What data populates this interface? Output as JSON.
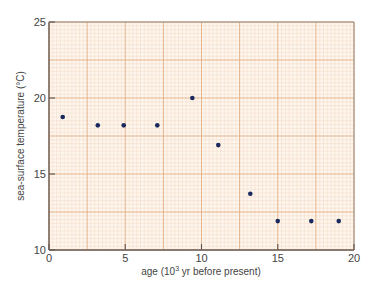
{
  "chart_data": {
    "type": "scatter",
    "title": "",
    "xlabel": "age (10^3 yr before present)",
    "xlabel_parts": {
      "pre": "age (10",
      "sup": "3",
      "post": " yr before present)"
    },
    "ylabel": "sea-surface temperature (°C)",
    "xlim": [
      0,
      20
    ],
    "ylim": [
      10,
      25
    ],
    "xticks": [
      0,
      5,
      10,
      15,
      20
    ],
    "yticks": [
      10,
      15,
      20,
      25
    ],
    "grid": true,
    "grid_major_step": 2.5,
    "grid_minor_step": 0.25,
    "legend": null,
    "series": [
      {
        "name": "sea-surface temperature",
        "color": "#1a2a5e",
        "points": [
          {
            "x": 0.9,
            "y": 18.75
          },
          {
            "x": 3.2,
            "y": 18.2
          },
          {
            "x": 4.9,
            "y": 18.2
          },
          {
            "x": 7.1,
            "y": 18.2
          },
          {
            "x": 9.4,
            "y": 20.0
          },
          {
            "x": 11.1,
            "y": 16.9
          },
          {
            "x": 13.2,
            "y": 13.7
          },
          {
            "x": 15.0,
            "y": 11.9
          },
          {
            "x": 17.2,
            "y": 11.9
          },
          {
            "x": 19.0,
            "y": 11.9
          }
        ]
      }
    ]
  },
  "colors": {
    "paper": "#fdf6ee",
    "grid_minor": "#f4d8c0",
    "grid_major": "#e2ad80",
    "frame": "#6b5a52",
    "point": "#1a2a5e"
  }
}
